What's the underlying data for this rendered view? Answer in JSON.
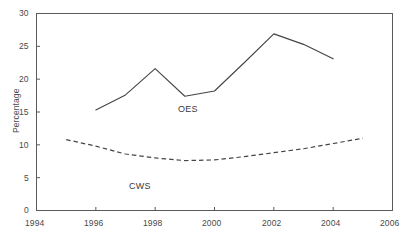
{
  "chart_data": {
    "type": "line",
    "title": "",
    "subtitle": "",
    "xlabel": "",
    "ylabel": "Percentage",
    "xlim": [
      1994,
      2006
    ],
    "ylim": [
      0,
      30
    ],
    "xticks": [
      1994,
      1996,
      1998,
      2000,
      2002,
      2004,
      2006
    ],
    "yticks": [
      0,
      5,
      10,
      15,
      20,
      25,
      30
    ],
    "xtick_labels": [
      "1994",
      "1996",
      "1998",
      "2000",
      "2002",
      "2004",
      "2006"
    ],
    "ytick_labels": [
      "0",
      "5",
      "10",
      "15",
      "20",
      "25",
      "30"
    ],
    "grid": false,
    "legend_position": "inline-annotations",
    "frame": "box",
    "series": [
      {
        "name": "OES",
        "style": "solid",
        "color": "#444444",
        "x": [
          1996,
          1997,
          1998,
          1999,
          2000,
          2001,
          2002,
          2003,
          2004
        ],
        "values": [
          15.3,
          17.6,
          21.6,
          17.4,
          18.2,
          22.5,
          26.9,
          25.3,
          23.1
        ],
        "label_text": "OES",
        "label_x": 2000.0,
        "label_y": 15.6
      },
      {
        "name": "CWS",
        "style": "dashed",
        "color": "#444444",
        "x": [
          1995,
          1996,
          1997,
          1998,
          1999,
          2000,
          2001,
          2002,
          2003,
          2004,
          2005
        ],
        "values": [
          10.8,
          9.8,
          8.6,
          8.0,
          7.6,
          7.7,
          8.2,
          8.8,
          9.4,
          10.2,
          11.0
        ],
        "label_text": "CWS",
        "label_x": 1998.6,
        "label_y": 3.8
      }
    ]
  },
  "axes": {
    "y_axis_title": "Percentage"
  }
}
